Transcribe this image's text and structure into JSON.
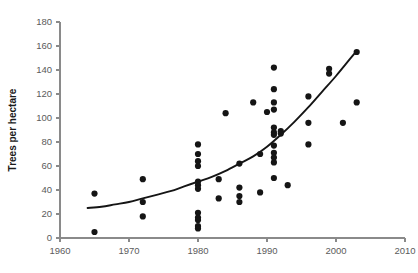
{
  "chart_data": {
    "type": "scatter",
    "title": "",
    "subtitle": "",
    "xlabel": "",
    "ylabel": "Trees per hectare",
    "xlim": [
      1960,
      2010
    ],
    "ylim": [
      0,
      180
    ],
    "xticks": [
      1960,
      1970,
      1980,
      1990,
      2000,
      2010
    ],
    "yticks": [
      0,
      20,
      40,
      60,
      80,
      100,
      120,
      140,
      160,
      180
    ],
    "xtick_labels": [
      "1960",
      "1970",
      "1980",
      "1990",
      "2000",
      "2010"
    ],
    "ytick_labels": [
      "0",
      "20",
      "40",
      "60",
      "80",
      "100",
      "120",
      "140",
      "160",
      "180"
    ],
    "xtick_interval": 10,
    "ytick_interval": 20,
    "grid": false,
    "legend": null,
    "legend_position": "none",
    "annotations": [],
    "marker": {
      "shape": "circle",
      "color": "#151515",
      "size": 3.1
    },
    "series": [
      {
        "name": "Trees per hectare observations",
        "marker_color": "#151515",
        "points": [
          {
            "x": 1965,
            "y": 37
          },
          {
            "x": 1965,
            "y": 5
          },
          {
            "x": 1972,
            "y": 49
          },
          {
            "x": 1972,
            "y": 30
          },
          {
            "x": 1972,
            "y": 18
          },
          {
            "x": 1980,
            "y": 78
          },
          {
            "x": 1980,
            "y": 70
          },
          {
            "x": 1980,
            "y": 64
          },
          {
            "x": 1980,
            "y": 60
          },
          {
            "x": 1980,
            "y": 47
          },
          {
            "x": 1980,
            "y": 44
          },
          {
            "x": 1980,
            "y": 41
          },
          {
            "x": 1980,
            "y": 21
          },
          {
            "x": 1980,
            "y": 17
          },
          {
            "x": 1980,
            "y": 15
          },
          {
            "x": 1980,
            "y": 10
          },
          {
            "x": 1980,
            "y": 8
          },
          {
            "x": 1983,
            "y": 49
          },
          {
            "x": 1983,
            "y": 33
          },
          {
            "x": 1984,
            "y": 104
          },
          {
            "x": 1986,
            "y": 62
          },
          {
            "x": 1986,
            "y": 42
          },
          {
            "x": 1986,
            "y": 35
          },
          {
            "x": 1986,
            "y": 30
          },
          {
            "x": 1988,
            "y": 113
          },
          {
            "x": 1989,
            "y": 70
          },
          {
            "x": 1989,
            "y": 38
          },
          {
            "x": 1991,
            "y": 142
          },
          {
            "x": 1991,
            "y": 124
          },
          {
            "x": 1991,
            "y": 113
          },
          {
            "x": 1991,
            "y": 107
          },
          {
            "x": 1991,
            "y": 92
          },
          {
            "x": 1991,
            "y": 88
          },
          {
            "x": 1991,
            "y": 86
          },
          {
            "x": 1991,
            "y": 77
          },
          {
            "x": 1991,
            "y": 71
          },
          {
            "x": 1991,
            "y": 67
          },
          {
            "x": 1991,
            "y": 63
          },
          {
            "x": 1991,
            "y": 50
          },
          {
            "x": 1992,
            "y": 89
          },
          {
            "x": 1992,
            "y": 87
          },
          {
            "x": 1993,
            "y": 44
          },
          {
            "x": 1990,
            "y": 105
          },
          {
            "x": 1996,
            "y": 118
          },
          {
            "x": 1996,
            "y": 96
          },
          {
            "x": 1996,
            "y": 78
          },
          {
            "x": 1999,
            "y": 141
          },
          {
            "x": 1999,
            "y": 137
          },
          {
            "x": 2001,
            "y": 96
          },
          {
            "x": 2003,
            "y": 155
          },
          {
            "x": 2003,
            "y": 113
          }
        ]
      }
    ],
    "fit_curve": {
      "name": "fitted trend",
      "style": "solid",
      "color": "#151515",
      "points": [
        {
          "x": 1964,
          "y": 25
        },
        {
          "x": 1966,
          "y": 26
        },
        {
          "x": 1968,
          "y": 28
        },
        {
          "x": 1970,
          "y": 30
        },
        {
          "x": 1972,
          "y": 33
        },
        {
          "x": 1974,
          "y": 36
        },
        {
          "x": 1976,
          "y": 39
        },
        {
          "x": 1978,
          "y": 43
        },
        {
          "x": 1980,
          "y": 47
        },
        {
          "x": 1982,
          "y": 51
        },
        {
          "x": 1984,
          "y": 56
        },
        {
          "x": 1986,
          "y": 62
        },
        {
          "x": 1988,
          "y": 68
        },
        {
          "x": 1990,
          "y": 76
        },
        {
          "x": 1992,
          "y": 86
        },
        {
          "x": 1994,
          "y": 97
        },
        {
          "x": 1996,
          "y": 109
        },
        {
          "x": 1998,
          "y": 122
        },
        {
          "x": 2000,
          "y": 135
        },
        {
          "x": 2002,
          "y": 149
        },
        {
          "x": 2003,
          "y": 156
        }
      ]
    }
  }
}
